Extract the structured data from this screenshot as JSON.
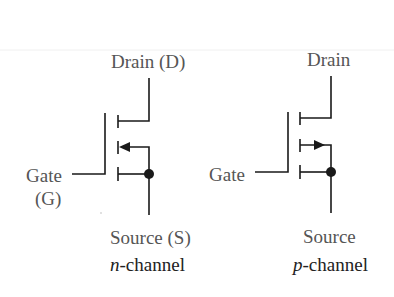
{
  "diagram": {
    "type": "MOSFET circuit symbols",
    "colors": {
      "line": "#1a1a1a",
      "label": "#555555",
      "caption": "#222222",
      "background": "#ffffff"
    },
    "n_channel": {
      "drain_label": "Drain (D)",
      "gate_label_line1": "Gate",
      "gate_label_line2": "(G)",
      "source_label": "Source (S)",
      "caption_prefix": "n",
      "caption_suffix": "-channel",
      "arrow_direction": "into channel (left)"
    },
    "p_channel": {
      "drain_label": "Drain",
      "gate_label": "Gate",
      "source_label": "Source",
      "caption_prefix": "p",
      "caption_suffix": "-channel",
      "arrow_direction": "out of channel (right)"
    }
  }
}
